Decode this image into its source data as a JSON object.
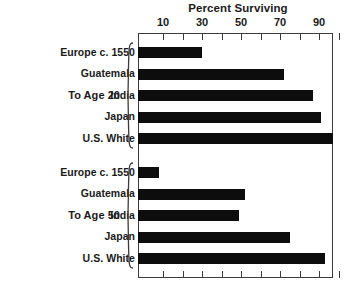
{
  "chart_data": {
    "type": "bar",
    "orientation": "horizontal",
    "title": "Percent Surviving",
    "xlabel": "",
    "ylabel": "",
    "xlim": [
      0,
      100
    ],
    "grid": false,
    "legend": false,
    "axis": {
      "tick_values": [
        10,
        20,
        30,
        40,
        50,
        60,
        70,
        80,
        90,
        100
      ],
      "labeled_ticks": [
        10,
        30,
        50,
        70,
        90
      ],
      "tick_labels": [
        "10",
        "30",
        "50",
        "70",
        "90"
      ],
      "ticks_on_top": true,
      "ticks_on_bottom": true
    },
    "groups": [
      {
        "label": "To Age 20",
        "categories": [
          "Europe c. 1550",
          "Guatemala",
          "India",
          "Japan",
          "U.S. White"
        ],
        "values": [
          30,
          72,
          87,
          91,
          97
        ]
      },
      {
        "label": "To Age 50",
        "categories": [
          "Europe c. 1550",
          "Guatemala",
          "India",
          "Japan",
          "U.S. White"
        ],
        "values": [
          8,
          52,
          49,
          75,
          93
        ]
      }
    ],
    "colors": {
      "bar": "#0d0d0d",
      "frame": "#3c3c3c",
      "text": "#1a1a1a",
      "background": "#ffffff"
    }
  }
}
